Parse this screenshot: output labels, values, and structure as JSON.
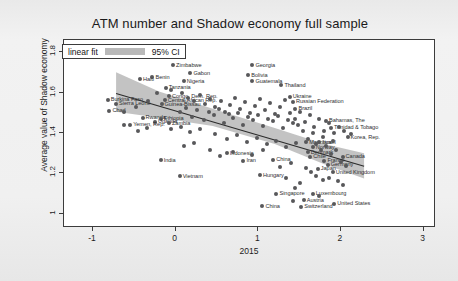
{
  "figure": {
    "title": "ATM number and Shadow economy full sample"
  },
  "legend": {
    "fit_label": "linear fit",
    "ci_label": "95% CI",
    "swatch_color": "#b9b9b9"
  },
  "axes": {
    "y_title": "Average value of Shadow economy",
    "x_title": "2015",
    "y_ticks": [
      "1",
      "1.2",
      "1.4",
      "1.6",
      "1.8"
    ],
    "x_ticks": [
      "-1",
      "0",
      "1",
      "2",
      "3"
    ]
  },
  "chart_data": {
    "type": "scatter",
    "title": "ATM number and Shadow economy full sample",
    "xlabel": "2015",
    "ylabel": "Average value of Shadow economy",
    "xlim": [
      -1.35,
      3.15
    ],
    "ylim": [
      0.93,
      1.86
    ],
    "grid": false,
    "legend_position": "top-left",
    "marker_color": "#58585a",
    "fit": {
      "label": "linear fit",
      "color": "#2b2b2b",
      "x_start": -0.72,
      "y_start": 1.595,
      "x_end": 2.28,
      "y_end": 1.235
    },
    "ci": {
      "label": "95% CI",
      "color": "#b9b9b9",
      "upper": [
        [
          -0.72,
          1.7
        ],
        [
          -0.2,
          1.605
        ],
        [
          0.45,
          1.52
        ],
        [
          1.2,
          1.425
        ],
        [
          1.8,
          1.345
        ],
        [
          2.28,
          1.3
        ]
      ],
      "lower": [
        [
          -0.72,
          1.505
        ],
        [
          -0.2,
          1.475
        ],
        [
          0.45,
          1.435
        ],
        [
          1.2,
          1.345
        ],
        [
          1.8,
          1.245
        ],
        [
          2.28,
          1.175
        ]
      ]
    },
    "points": [
      {
        "label": "Zimbabwe",
        "x": -0.03,
        "y": 1.735
      },
      {
        "label": "Georgia",
        "x": 0.93,
        "y": 1.735
      },
      {
        "label": "Benin",
        "x": -0.28,
        "y": 1.675
      },
      {
        "label": "Gabon",
        "x": 0.18,
        "y": 1.695
      },
      {
        "label": "Bolivia",
        "x": 0.88,
        "y": 1.685
      },
      {
        "label": "Nigeria",
        "x": 0.1,
        "y": 1.655
      },
      {
        "label": "Guatemala",
        "x": 0.93,
        "y": 1.655
      },
      {
        "label": "Tanzania",
        "x": -0.12,
        "y": 1.625
      },
      {
        "label": "Thailand",
        "x": 1.28,
        "y": 1.635
      },
      {
        "label": "Haiti",
        "x": -0.43,
        "y": 1.665
      },
      {
        "label": "Burkina Faso",
        "x": -0.82,
        "y": 1.565
      },
      {
        "label": "Sierra Leone",
        "x": -0.72,
        "y": 1.545
      },
      {
        "label": "Chad",
        "x": -0.8,
        "y": 1.51
      },
      {
        "label": "Congo, Dem. Rep.",
        "x": -0.08,
        "y": 1.582
      },
      {
        "label": "Central African Rep.",
        "x": -0.13,
        "y": 1.562
      },
      {
        "label": "Guinea-Bissau",
        "x": -0.17,
        "y": 1.542
      },
      {
        "label": "Rwanda",
        "x": -0.4,
        "y": 1.475
      },
      {
        "label": "Ukraine",
        "x": 1.38,
        "y": 1.58
      },
      {
        "label": "Russian Federation",
        "x": 1.42,
        "y": 1.555
      },
      {
        "label": "Brazil",
        "x": 1.45,
        "y": 1.52
      },
      {
        "label": "Ethiopia",
        "x": -0.18,
        "y": 1.47
      },
      {
        "label": "Uganda",
        "x": -0.25,
        "y": 1.455
      },
      {
        "label": "Yemen, Rep.",
        "x": -0.55,
        "y": 1.44
      },
      {
        "label": "Zambia",
        "x": -0.08,
        "y": 1.448
      },
      {
        "label": "Bahamas, The",
        "x": 1.82,
        "y": 1.46
      },
      {
        "label": "Trinidad & Tobago",
        "x": 1.88,
        "y": 1.425
      },
      {
        "label": "Korea, Rep.",
        "x": 2.08,
        "y": 1.378
      },
      {
        "label": "Mauritius",
        "x": 1.58,
        "y": 1.355
      },
      {
        "label": "Israel",
        "x": 1.74,
        "y": 1.355
      },
      {
        "label": "Norway",
        "x": 1.66,
        "y": 1.33
      },
      {
        "label": "Denmark",
        "x": 1.6,
        "y": 1.305
      },
      {
        "label": "Chile",
        "x": 1.63,
        "y": 1.282
      },
      {
        "label": "Canada",
        "x": 2.02,
        "y": 1.282
      },
      {
        "label": "France",
        "x": 1.8,
        "y": 1.262
      },
      {
        "label": "Germany",
        "x": 1.84,
        "y": 1.242
      },
      {
        "label": "Japan",
        "x": 1.72,
        "y": 1.222
      },
      {
        "label": "United Kingdom",
        "x": 1.9,
        "y": 1.205
      },
      {
        "label": "Indonesia",
        "x": 0.62,
        "y": 1.3
      },
      {
        "label": "India",
        "x": -0.18,
        "y": 1.265
      },
      {
        "label": "Iran",
        "x": 0.82,
        "y": 1.262
      },
      {
        "label": "China",
        "x": 1.18,
        "y": 1.268
      },
      {
        "label": "Vietnam",
        "x": 0.05,
        "y": 1.185
      },
      {
        "label": "Hungary",
        "x": 1.02,
        "y": 1.192
      },
      {
        "label": "Singapore",
        "x": 1.22,
        "y": 1.1
      },
      {
        "label": "Luxembourg",
        "x": 1.66,
        "y": 1.1
      },
      {
        "label": "Austria",
        "x": 1.55,
        "y": 1.068
      },
      {
        "label": "United States",
        "x": 1.92,
        "y": 1.05
      },
      {
        "label": "Switzerland",
        "x": 1.52,
        "y": 1.035
      },
      {
        "label": "China2",
        "x": 1.05,
        "y": 1.038
      },
      {
        "label": "",
        "x": -0.62,
        "y": 1.505
      },
      {
        "label": "",
        "x": -0.48,
        "y": 1.53
      },
      {
        "label": "",
        "x": -0.33,
        "y": 1.56
      },
      {
        "label": "",
        "x": -0.22,
        "y": 1.6
      },
      {
        "label": "",
        "x": -0.05,
        "y": 1.615
      },
      {
        "label": "",
        "x": 0.08,
        "y": 1.6
      },
      {
        "label": "",
        "x": 0.15,
        "y": 1.575
      },
      {
        "label": "",
        "x": 0.22,
        "y": 1.556
      },
      {
        "label": "",
        "x": 0.3,
        "y": 1.59
      },
      {
        "label": "",
        "x": 0.36,
        "y": 1.545
      },
      {
        "label": "",
        "x": 0.42,
        "y": 1.57
      },
      {
        "label": "",
        "x": 0.48,
        "y": 1.53
      },
      {
        "label": "",
        "x": 0.55,
        "y": 1.56
      },
      {
        "label": "",
        "x": 0.6,
        "y": 1.505
      },
      {
        "label": "",
        "x": 0.66,
        "y": 1.54
      },
      {
        "label": "",
        "x": 0.72,
        "y": 1.575
      },
      {
        "label": "",
        "x": 0.78,
        "y": 1.52
      },
      {
        "label": "",
        "x": 0.84,
        "y": 1.555
      },
      {
        "label": "",
        "x": 0.9,
        "y": 1.498
      },
      {
        "label": "",
        "x": 0.96,
        "y": 1.535
      },
      {
        "label": "",
        "x": 1.02,
        "y": 1.57
      },
      {
        "label": "",
        "x": 1.08,
        "y": 1.512
      },
      {
        "label": "",
        "x": 1.14,
        "y": 1.548
      },
      {
        "label": "",
        "x": 1.2,
        "y": 1.492
      },
      {
        "label": "",
        "x": 1.26,
        "y": 1.528
      },
      {
        "label": "",
        "x": 1.32,
        "y": 1.562
      },
      {
        "label": "",
        "x": 1.38,
        "y": 1.5
      },
      {
        "label": "",
        "x": 1.44,
        "y": 1.47
      },
      {
        "label": "",
        "x": 1.5,
        "y": 1.505
      },
      {
        "label": "",
        "x": 1.56,
        "y": 1.455
      },
      {
        "label": "",
        "x": 1.62,
        "y": 1.49
      },
      {
        "label": "",
        "x": 1.68,
        "y": 1.43
      },
      {
        "label": "",
        "x": 1.74,
        "y": 1.468
      },
      {
        "label": "",
        "x": 1.8,
        "y": 1.412
      },
      {
        "label": "",
        "x": 1.86,
        "y": 1.448
      },
      {
        "label": "",
        "x": 1.92,
        "y": 1.398
      },
      {
        "label": "",
        "x": 1.98,
        "y": 1.432
      },
      {
        "label": "",
        "x": 2.04,
        "y": 1.412
      },
      {
        "label": "",
        "x": 2.12,
        "y": 1.395
      },
      {
        "label": "",
        "x": 0.2,
        "y": 1.48
      },
      {
        "label": "",
        "x": 0.34,
        "y": 1.462
      },
      {
        "label": "",
        "x": 0.46,
        "y": 1.488
      },
      {
        "label": "",
        "x": 0.58,
        "y": 1.448
      },
      {
        "label": "",
        "x": 0.7,
        "y": 1.475
      },
      {
        "label": "",
        "x": 0.82,
        "y": 1.44
      },
      {
        "label": "",
        "x": 0.94,
        "y": 1.462
      },
      {
        "label": "",
        "x": 1.06,
        "y": 1.435
      },
      {
        "label": "",
        "x": 1.18,
        "y": 1.458
      },
      {
        "label": "",
        "x": 1.3,
        "y": 1.425
      },
      {
        "label": "",
        "x": 1.42,
        "y": 1.448
      },
      {
        "label": "",
        "x": 1.54,
        "y": 1.408
      },
      {
        "label": "",
        "x": 1.66,
        "y": 1.398
      },
      {
        "label": "",
        "x": 1.78,
        "y": 1.378
      },
      {
        "label": "",
        "x": 1.9,
        "y": 1.362
      },
      {
        "label": "",
        "x": 0.05,
        "y": 1.505
      },
      {
        "label": "",
        "x": 0.12,
        "y": 1.525
      },
      {
        "label": "",
        "x": 0.26,
        "y": 1.512
      },
      {
        "label": "",
        "x": 0.4,
        "y": 1.505
      },
      {
        "label": "",
        "x": 0.52,
        "y": 1.518
      },
      {
        "label": "",
        "x": 0.64,
        "y": 1.492
      },
      {
        "label": "",
        "x": 0.76,
        "y": 1.5
      },
      {
        "label": "",
        "x": 0.88,
        "y": 1.478
      },
      {
        "label": "",
        "x": 1.0,
        "y": 1.488
      },
      {
        "label": "",
        "x": 1.12,
        "y": 1.47
      },
      {
        "label": "",
        "x": 1.24,
        "y": 1.482
      },
      {
        "label": "",
        "x": 1.36,
        "y": 1.462
      },
      {
        "label": "",
        "x": 1.48,
        "y": 1.44
      },
      {
        "label": "",
        "x": 1.6,
        "y": 1.372
      },
      {
        "label": "",
        "x": 1.7,
        "y": 1.348
      },
      {
        "label": "",
        "x": 1.76,
        "y": 1.318
      },
      {
        "label": "",
        "x": 1.82,
        "y": 1.338
      },
      {
        "label": "",
        "x": 1.88,
        "y": 1.298
      },
      {
        "label": "",
        "x": 1.94,
        "y": 1.318
      },
      {
        "label": "",
        "x": 2.0,
        "y": 1.258
      },
      {
        "label": "",
        "x": 2.06,
        "y": 1.235
      },
      {
        "label": "",
        "x": 1.58,
        "y": 1.228
      },
      {
        "label": "",
        "x": 1.64,
        "y": 1.205
      },
      {
        "label": "",
        "x": 1.7,
        "y": 1.185
      },
      {
        "label": "",
        "x": 1.78,
        "y": 1.165
      },
      {
        "label": "",
        "x": 1.86,
        "y": 1.178
      },
      {
        "label": "",
        "x": 0.48,
        "y": 1.395
      },
      {
        "label": "",
        "x": 0.62,
        "y": 1.372
      },
      {
        "label": "",
        "x": 0.74,
        "y": 1.392
      },
      {
        "label": "",
        "x": 0.86,
        "y": 1.355
      },
      {
        "label": "",
        "x": 0.98,
        "y": 1.375
      },
      {
        "label": "",
        "x": 1.1,
        "y": 1.345
      },
      {
        "label": "",
        "x": 1.22,
        "y": 1.362
      },
      {
        "label": "",
        "x": 1.34,
        "y": 1.332
      },
      {
        "label": "",
        "x": 1.46,
        "y": 1.352
      },
      {
        "label": "",
        "x": 0.3,
        "y": 1.42
      },
      {
        "label": "",
        "x": 0.18,
        "y": 1.405
      },
      {
        "label": "",
        "x": 0.06,
        "y": 1.432
      },
      {
        "label": "",
        "x": -0.06,
        "y": 1.418
      },
      {
        "label": "",
        "x": 0.42,
        "y": 1.318
      },
      {
        "label": "",
        "x": 0.54,
        "y": 1.288
      },
      {
        "label": "",
        "x": 0.7,
        "y": 1.308
      },
      {
        "label": "",
        "x": 0.92,
        "y": 1.292
      },
      {
        "label": "",
        "x": 1.06,
        "y": 1.315
      },
      {
        "label": "",
        "x": 1.26,
        "y": 1.232
      },
      {
        "label": "",
        "x": 1.4,
        "y": 1.252
      },
      {
        "label": "",
        "x": 1.5,
        "y": 1.152
      },
      {
        "label": "",
        "x": 1.44,
        "y": 1.128
      },
      {
        "label": "",
        "x": 1.34,
        "y": 1.175
      },
      {
        "label": "",
        "x": -0.35,
        "y": 1.425
      },
      {
        "label": "",
        "x": -0.45,
        "y": 1.408
      },
      {
        "label": "",
        "x": -0.62,
        "y": 1.438
      },
      {
        "label": "",
        "x": 0.22,
        "y": 1.352
      },
      {
        "label": "",
        "x": 0.1,
        "y": 1.338
      },
      {
        "label": "",
        "x": 1.96,
        "y": 1.162
      },
      {
        "label": "",
        "x": 2.02,
        "y": 1.142
      },
      {
        "label": "",
        "x": 1.74,
        "y": 1.088
      },
      {
        "label": "",
        "x": 1.42,
        "y": 1.062
      }
    ]
  }
}
